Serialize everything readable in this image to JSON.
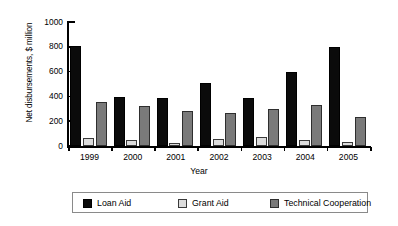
{
  "chart_data": {
    "type": "bar",
    "title": "",
    "xlabel": "Year",
    "ylabel": "Net disbursements, $ million",
    "categories": [
      "1999",
      "2000",
      "2001",
      "2002",
      "2003",
      "2004",
      "2005"
    ],
    "series": [
      {
        "name": "Loan Aid",
        "color": "#0b0b0b",
        "values": [
          810,
          398,
          387,
          512,
          390,
          595,
          798
        ]
      },
      {
        "name": "Grant Aid",
        "color": "#dcdcdc",
        "values": [
          65,
          50,
          22,
          55,
          75,
          50,
          35
        ]
      },
      {
        "name": "Technical Cooperation",
        "color": "#7a7a7a",
        "values": [
          352,
          322,
          280,
          268,
          302,
          327,
          238
        ]
      }
    ],
    "ylim": [
      0,
      1000
    ],
    "yticks": [
      0,
      200,
      400,
      600,
      800,
      1000
    ],
    "ytick_labels": [
      "0",
      "200",
      "400",
      "600",
      "800",
      "1000"
    ],
    "grid": false,
    "legend_position": "bottom"
  }
}
